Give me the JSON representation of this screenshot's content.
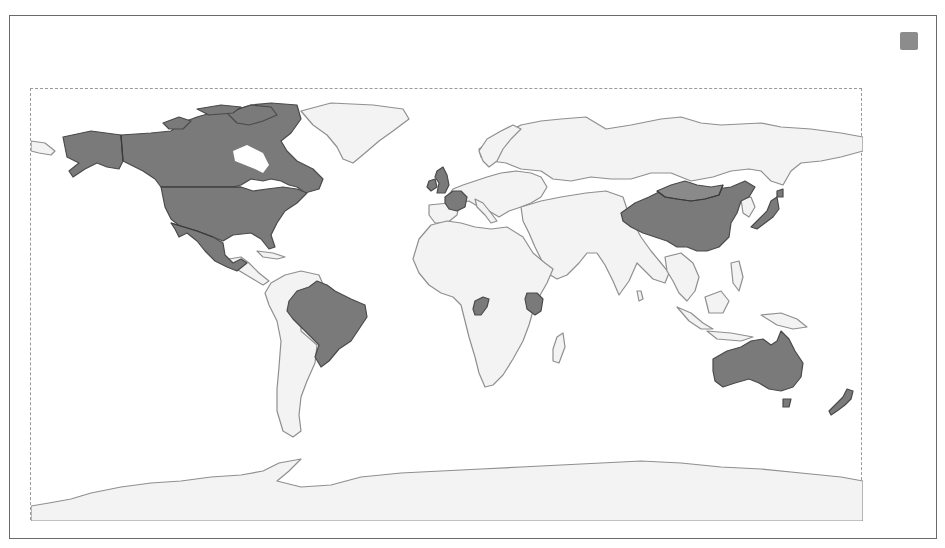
{
  "chart": {
    "type": "choropleth-world-map",
    "projection": "equirectangular",
    "highlight_color": "#7a7a7a",
    "base_color": "#f3f3f3",
    "outline_color": "#8f8f8f",
    "highlighted_countries": [
      "Canada",
      "United States",
      "Mexico",
      "Brazil",
      "United Kingdom",
      "Ireland",
      "France",
      "Republic of the Congo",
      "Kenya",
      "China",
      "Mongolia",
      "Japan",
      "Australia",
      "New Zealand"
    ]
  },
  "legend": {
    "swatch_color": "#8c8c8c",
    "label": ""
  }
}
